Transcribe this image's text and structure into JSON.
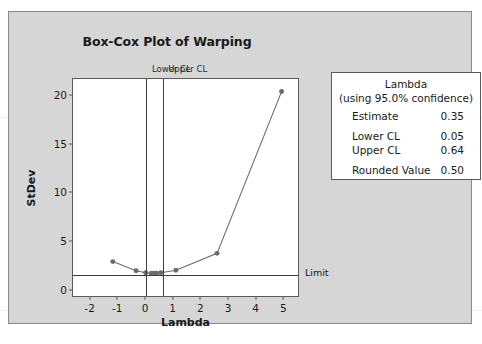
{
  "chart_data": {
    "type": "line",
    "title": "Box-Cox Plot of Warping",
    "xlabel": "Lambda",
    "ylabel": "StDev",
    "xlim": [
      -2.6,
      5.6
    ],
    "ylim": [
      -0.8,
      21.6
    ],
    "xticks": [
      "-2",
      "-1",
      "0",
      "1",
      "2",
      "3",
      "4",
      "5"
    ],
    "xtick_values": [
      -2,
      -1,
      0,
      1,
      2,
      3,
      4,
      5
    ],
    "yticks": [
      "0",
      "5",
      "10",
      "15",
      "20"
    ],
    "ytick_values": [
      0,
      5,
      10,
      15,
      20
    ],
    "grid": false,
    "legend_position": "right",
    "series": [
      {
        "name": "StDev vs Lambda",
        "marker": "circle",
        "color": "#6b6b6b",
        "x": [
          -1.15,
          -0.3,
          0.05,
          0.25,
          0.35,
          0.45,
          0.6,
          1.15,
          2.65,
          5.0
        ],
        "y": [
          2.75,
          1.8,
          1.6,
          1.55,
          1.55,
          1.55,
          1.6,
          1.85,
          3.6,
          20.3
        ]
      }
    ],
    "reference_lines": [
      {
        "name": "lower-cl",
        "orientation": "vertical",
        "value": 0.05,
        "label": "Lower CL"
      },
      {
        "name": "upper-cl",
        "orientation": "vertical",
        "value": 0.64,
        "label": "Upper CL"
      },
      {
        "name": "limit",
        "orientation": "horizontal",
        "value": 1.55,
        "label": "Limit"
      }
    ]
  },
  "legend": {
    "title": "Lambda",
    "subtitle": "(using 95.0% confidence)",
    "rows": [
      {
        "key": "Estimate",
        "value": "0.35"
      },
      {
        "key": "Lower CL",
        "value": "0.05"
      },
      {
        "key": "Upper CL",
        "value": "0.64"
      },
      {
        "key": "Rounded Value",
        "value": "0.50"
      }
    ]
  },
  "colors": {
    "panel_background": "#d6d6d6",
    "plot_background": "#ffffff",
    "axis": "#5a5a5a",
    "series": "#6b6b6b",
    "reference_line": "#3c3c3c",
    "text": "#1a1a1a"
  },
  "footer": {
    "caption": ""
  }
}
